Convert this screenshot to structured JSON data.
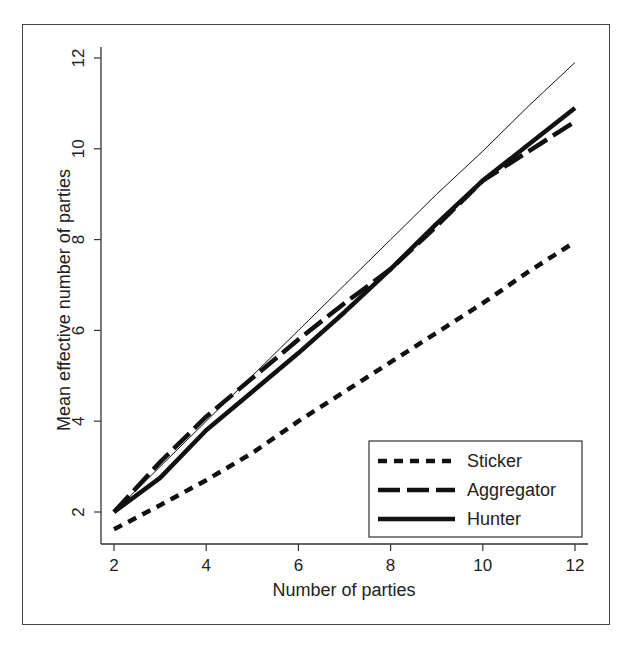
{
  "chart_data": {
    "type": "line",
    "title": "",
    "xlabel": "Number of parties",
    "ylabel": "Mean effective number of parties",
    "xlim": [
      2,
      12
    ],
    "ylim": [
      1.4,
      12.4
    ],
    "xticks": [
      2,
      4,
      6,
      8,
      10,
      12
    ],
    "yticks": [
      2,
      4,
      6,
      8,
      10,
      12
    ],
    "grid": false,
    "legend_position": "lower right",
    "x": [
      2,
      3,
      4,
      5,
      6,
      7,
      8,
      9,
      10,
      11,
      12
    ],
    "series": [
      {
        "name": "Sticker",
        "style": "short-dash",
        "values": [
          1.62,
          2.15,
          2.7,
          3.3,
          4.0,
          4.65,
          5.3,
          5.95,
          6.6,
          7.3,
          7.95
        ]
      },
      {
        "name": "Aggregator",
        "style": "long-dash",
        "values": [
          2.0,
          3.1,
          4.1,
          4.95,
          5.8,
          6.6,
          7.35,
          8.3,
          9.3,
          9.95,
          10.6
        ]
      },
      {
        "name": "Hunter",
        "style": "solid",
        "values": [
          2.0,
          2.75,
          3.8,
          4.65,
          5.5,
          6.4,
          7.35,
          8.35,
          9.3,
          10.1,
          10.9
        ]
      },
      {
        "name": "reference (y = x)",
        "style": "thin-solid",
        "in_legend": false,
        "values": [
          2.0,
          3.0,
          4.0,
          5.0,
          6.0,
          7.0,
          8.0,
          9.0,
          9.95,
          10.95,
          11.9
        ]
      }
    ]
  }
}
